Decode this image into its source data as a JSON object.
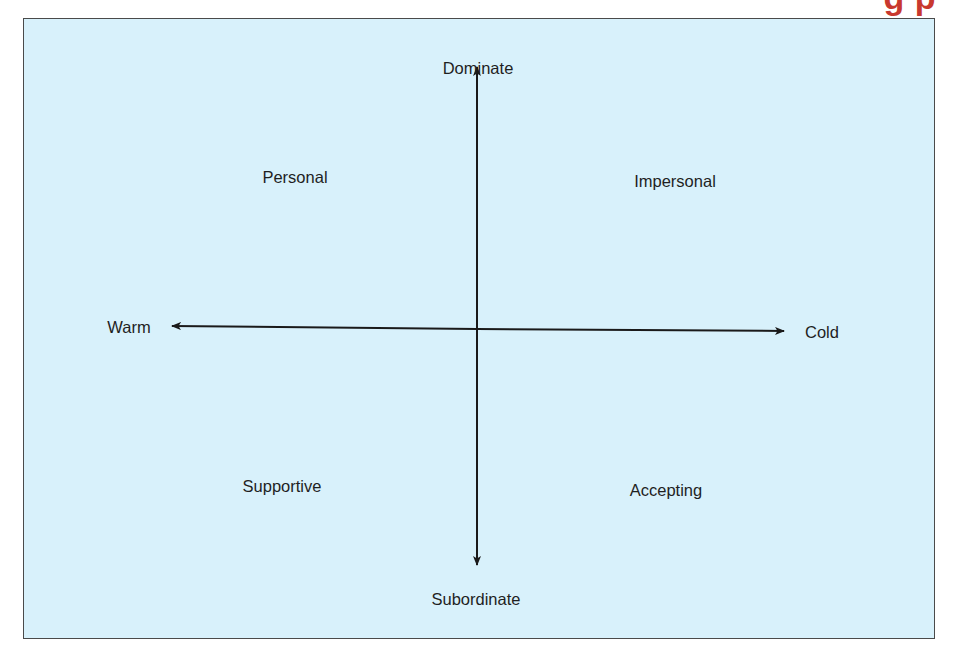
{
  "header": {
    "partial_title": "g   p"
  },
  "diagram": {
    "type": "quadrant-axes",
    "axes": {
      "vertical": {
        "top": "Dominate",
        "bottom": "Subordinate"
      },
      "horizontal": {
        "left": "Warm",
        "right": "Cold"
      }
    },
    "quadrants": {
      "top_left": "Personal",
      "top_right": "Impersonal",
      "bottom_left": "Supportive",
      "bottom_right": "Accepting"
    },
    "colors": {
      "background": "#d8f1fb",
      "border": "#4a4a4a",
      "axis": "#1a1a1a",
      "text": "#1f1f1f",
      "header_accent": "#c8382e"
    }
  }
}
